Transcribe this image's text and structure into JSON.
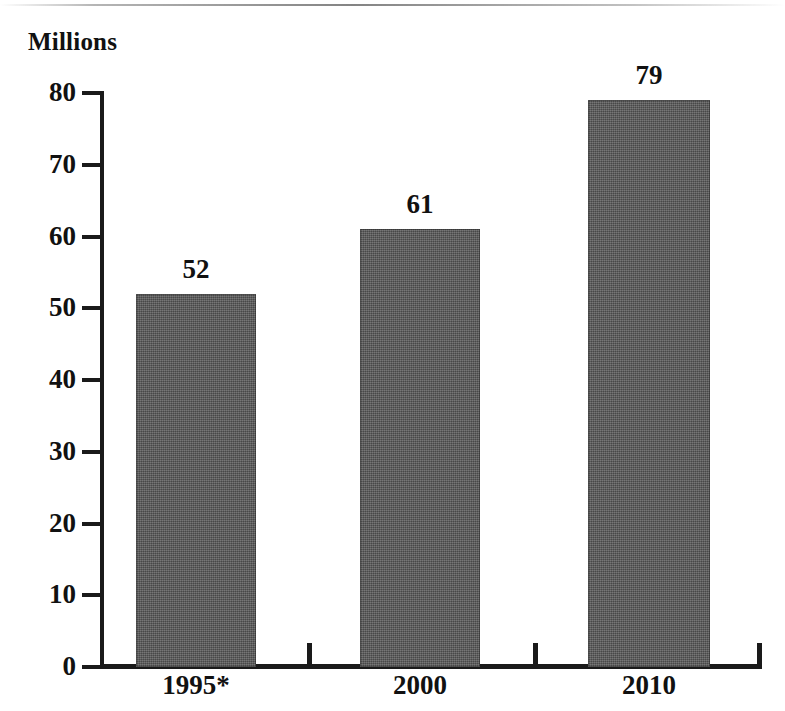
{
  "chart_data": {
    "type": "bar",
    "title": "",
    "unit_label": "Millions",
    "xlabel": "",
    "ylabel": "Millions",
    "categories": [
      "1995*",
      "2000",
      "2010"
    ],
    "values": [
      52,
      61,
      79
    ],
    "value_labels": [
      "52",
      "61",
      "79"
    ],
    "ylim": [
      0,
      80
    ],
    "ytick_labels": [
      "0",
      "10",
      "20",
      "30",
      "40",
      "50",
      "60",
      "70",
      "80"
    ],
    "ytick_values": [
      0,
      10,
      20,
      30,
      40,
      50,
      60,
      70,
      80
    ],
    "grid": false,
    "legend": false,
    "series": [
      {
        "name": "",
        "values": [
          52,
          61,
          79
        ],
        "color": "#585858"
      }
    ],
    "footnote_marker": "*",
    "bar_color": "#585858",
    "axis_color": "#1a1a1a",
    "background_color": "#ffffff"
  }
}
